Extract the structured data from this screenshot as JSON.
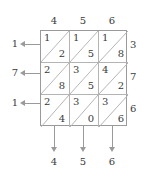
{
  "diagram": {
    "type": "lattice-multiplication-grid",
    "rows": 3,
    "columns": 3,
    "column_headers": [
      "4",
      "5",
      "6"
    ],
    "left_labels": [
      "1",
      "7",
      "1"
    ],
    "right_labels": [
      "3",
      "7",
      "6"
    ],
    "bottom_labels": [
      "4",
      "5",
      "6"
    ],
    "cells": [
      [
        {
          "upper": "1",
          "lower": "2"
        },
        {
          "upper": "1",
          "lower": "5"
        },
        {
          "upper": "1",
          "lower": "8"
        }
      ],
      [
        {
          "upper": "2",
          "lower": "8"
        },
        {
          "upper": "3",
          "lower": "5"
        },
        {
          "upper": "4",
          "lower": "2"
        }
      ],
      [
        {
          "upper": "2",
          "lower": "4"
        },
        {
          "upper": "3",
          "lower": "0"
        },
        {
          "upper": "3",
          "lower": "6"
        }
      ]
    ],
    "colors": {
      "line": "#9a9a9a",
      "inner_line": "#b4b4b4",
      "text": "#3a3a3a",
      "background": "#ffffff"
    }
  }
}
